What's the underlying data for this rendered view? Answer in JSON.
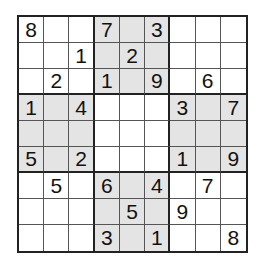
{
  "puzzle": {
    "type": "sudoku",
    "size": 9,
    "shaded_boxes": [
      [
        0,
        1
      ],
      [
        1,
        0
      ],
      [
        1,
        2
      ],
      [
        2,
        1
      ]
    ],
    "colors": {
      "shaded": "#e4e4e4",
      "background": "#ffffff",
      "line": "#222222"
    },
    "rows": [
      [
        "8",
        "",
        "",
        "7",
        "",
        "3",
        "",
        "",
        ""
      ],
      [
        "",
        "",
        "1",
        "",
        "2",
        "",
        "",
        "",
        ""
      ],
      [
        "",
        "2",
        "",
        "1",
        "",
        "9",
        "",
        "6",
        ""
      ],
      [
        "1",
        "",
        "4",
        "",
        "",
        "",
        "3",
        "",
        "7"
      ],
      [
        "",
        "",
        "",
        "",
        "",
        "",
        "",
        "",
        ""
      ],
      [
        "5",
        "",
        "2",
        "",
        "",
        "",
        "1",
        "",
        "9"
      ],
      [
        "",
        "5",
        "",
        "6",
        "",
        "4",
        "",
        "7",
        ""
      ],
      [
        "",
        "",
        "",
        "",
        "5",
        "",
        "9",
        "",
        ""
      ],
      [
        "",
        "",
        "",
        "3",
        "",
        "1",
        "",
        "",
        "8"
      ]
    ]
  }
}
